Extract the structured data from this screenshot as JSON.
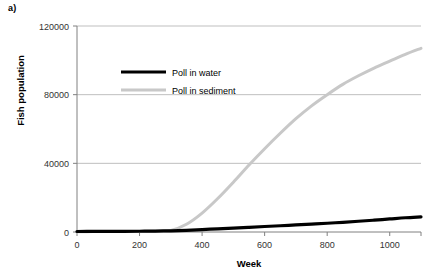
{
  "panel": {
    "label": "a)"
  },
  "chart_data": {
    "type": "line",
    "title": "",
    "xlabel": "Week",
    "ylabel": "Fish population",
    "xlim": [
      0,
      1100
    ],
    "ylim": [
      0,
      120000
    ],
    "xticks": [
      0,
      200,
      400,
      600,
      800,
      1000
    ],
    "xtick_labels": [
      "0",
      "200",
      "400",
      "600",
      "800",
      "1000"
    ],
    "yticks": [
      0,
      40000,
      80000,
      120000
    ],
    "ytick_labels": [
      "0",
      "40000",
      "80000",
      "120000"
    ],
    "grid": "horizontal",
    "legend_position": "upper-left-inside",
    "colors": {
      "water": "#000000",
      "sediment": "#c8c8c8",
      "axis": "#808080",
      "gridline": "#bfbfbf"
    },
    "x": [
      0,
      50,
      100,
      150,
      200,
      250,
      300,
      350,
      400,
      450,
      500,
      550,
      600,
      650,
      700,
      750,
      800,
      850,
      900,
      950,
      1000,
      1050,
      1100
    ],
    "series": [
      {
        "name": "Poll in water",
        "values": [
          300,
          330,
          360,
          400,
          450,
          520,
          700,
          1000,
          1400,
          1850,
          2300,
          2750,
          3200,
          3650,
          4100,
          4600,
          5100,
          5650,
          6250,
          6900,
          7600,
          8300,
          8800
        ]
      },
      {
        "name": "Poll in sediment",
        "values": [
          200,
          220,
          250,
          290,
          340,
          420,
          900,
          4500,
          11000,
          19500,
          29000,
          39000,
          48500,
          57500,
          66000,
          73500,
          80000,
          86000,
          91000,
          95500,
          99500,
          103500,
          107000
        ]
      }
    ]
  },
  "legend": {
    "items": [
      {
        "label": "Poll in water",
        "series": "Poll in water"
      },
      {
        "label": "Poll in sediment",
        "series": "Poll in sediment"
      }
    ]
  }
}
